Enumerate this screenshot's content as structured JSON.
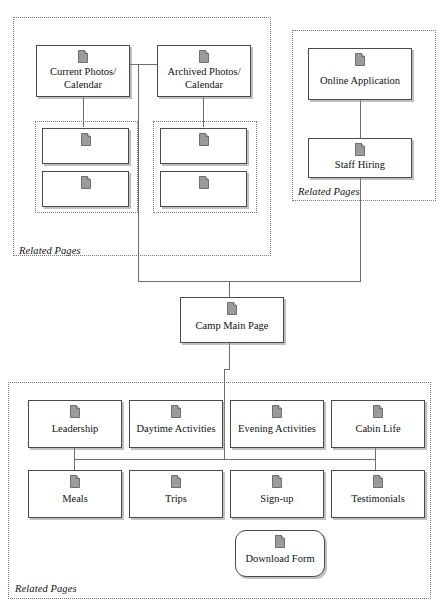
{
  "diagram": {
    "type": "sitemap-flowchart",
    "icon_name": "document-icon",
    "colors": {
      "node_border": "#4a4a4a",
      "node_fill": "#ffffff",
      "node_shadow": "#8c8c8c",
      "group_border": "#7a7a7a",
      "connector": "#6e6e6e",
      "icon_fill": "#9b9b9b",
      "text": "#111111"
    }
  },
  "groups": [
    {
      "id": "photos-group",
      "label": "Related Pages"
    },
    {
      "id": "current-photos-subgroup",
      "label": ""
    },
    {
      "id": "archived-photos-subgroup",
      "label": ""
    },
    {
      "id": "hiring-group",
      "label": "Related Pages"
    },
    {
      "id": "camp-pages-group",
      "label": "Related Pages"
    }
  ],
  "nodes": {
    "current_photos": {
      "label": "Current Photos/\nCalendar"
    },
    "archived_photos": {
      "label": "Archived Photos/\nCalendar"
    },
    "current_child_1": {
      "label": ""
    },
    "current_child_2": {
      "label": ""
    },
    "archived_child_1": {
      "label": ""
    },
    "archived_child_2": {
      "label": ""
    },
    "online_application": {
      "label": "Online Application"
    },
    "staff_hiring": {
      "label": "Staff Hiring"
    },
    "camp_main_page": {
      "label": "Camp Main Page"
    },
    "leadership": {
      "label": "Leadership"
    },
    "daytime_activities": {
      "label": "Daytime Activities"
    },
    "evening_activities": {
      "label": "Evening Activities"
    },
    "cabin_life": {
      "label": "Cabin Life"
    },
    "meals": {
      "label": "Meals"
    },
    "trips": {
      "label": "Trips"
    },
    "signup": {
      "label": "Sign-up"
    },
    "testimonials": {
      "label": "Testimonials"
    },
    "download_form": {
      "label": "Download Form"
    }
  }
}
